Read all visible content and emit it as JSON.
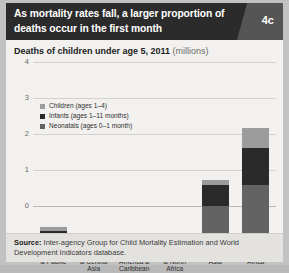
{
  "header": {
    "title": "As mortality rates fall, a larger proportion of deaths occur in the first month",
    "badge": "4c"
  },
  "subtitle": {
    "main": "Deaths of children under age 5, 2011",
    "unit": "(millions)"
  },
  "source": {
    "label": "Source:",
    "text": " Inter-agency Group for Child Mortality Estimation and World Development Indicators database."
  },
  "colors": {
    "children": "#9c9c9c",
    "infants": "#2a2a2a",
    "neonatals": "#636363",
    "header_bg": "#2b2b2b",
    "badge_bg": "#555555",
    "panel_bg": "#f2f1ef",
    "grid": "#d2d1cd"
  },
  "chart_data": {
    "type": "bar",
    "stacked": true,
    "title": "Deaths of children under age 5, 2011 (millions)",
    "xlabel": "",
    "ylabel": "",
    "ylim": [
      0,
      4
    ],
    "yticks": [
      4,
      3,
      2,
      1,
      0
    ],
    "grid": true,
    "legend_position": "top-left",
    "categories": [
      "East Asia & Pacific",
      "Europe & Central Asia",
      "Latin America & Caribbean",
      "Middle East & North Africa",
      "South Asia",
      "Sub-Saharan Africa"
    ],
    "category_lines": [
      [
        "East Asia",
        "& Pacific"
      ],
      [
        "Europe",
        "& Central",
        "Asia"
      ],
      [
        "Latin",
        "America &",
        "Caribbean"
      ],
      [
        "Middle East",
        "& North",
        "Africa"
      ],
      [
        "South",
        "Asia"
      ],
      [
        "Sub-Saharan",
        "Africa"
      ]
    ],
    "series": [
      {
        "name": "Children (ages 1–4)",
        "key": "children",
        "color": "#9c9c9c",
        "values": [
          0.1,
          0.02,
          0.02,
          0.03,
          0.13,
          0.55
        ]
      },
      {
        "name": "Infants (ages 1–11 months)",
        "key": "infants",
        "color": "#2a2a2a",
        "values": [
          0.17,
          0.04,
          0.06,
          0.07,
          0.58,
          1.02
        ]
      },
      {
        "name": "Neonatals (ages 0–1 month)",
        "key": "neonatals",
        "color": "#636363",
        "values": [
          0.28,
          0.09,
          0.11,
          0.13,
          1.14,
          1.73
        ]
      }
    ],
    "totals": [
      0.55,
      0.15,
      0.19,
      0.23,
      1.85,
      3.3
    ]
  }
}
